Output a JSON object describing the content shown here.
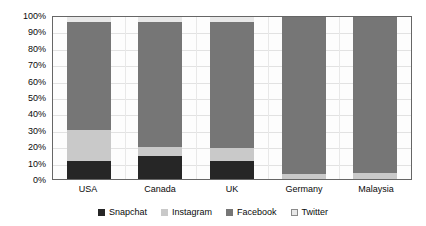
{
  "chart_data": {
    "type": "bar",
    "subtype": "stacked-100-percent",
    "title": "",
    "xlabel": "",
    "ylabel": "",
    "categories": [
      "USA",
      "Canada",
      "UK",
      "Germany",
      "Malaysia"
    ],
    "series": [
      {
        "name": "Snapchat",
        "color": "#262626",
        "values": [
          11,
          14,
          11,
          0,
          0
        ]
      },
      {
        "name": "Instagram",
        "color": "#c9c9c9",
        "values": [
          19,
          6,
          8,
          3,
          4
        ]
      },
      {
        "name": "Facebook",
        "color": "#767676",
        "values": [
          67,
          77,
          78,
          97,
          96
        ]
      },
      {
        "name": "Twitter",
        "color": "#e8e8e8",
        "values": [
          3,
          3,
          3,
          0,
          0
        ]
      }
    ],
    "ylim": [
      0,
      100
    ],
    "y_ticks": [
      "100%",
      "90%",
      "80%",
      "70%",
      "60%",
      "50%",
      "40%",
      "30%",
      "20%",
      "10%",
      "0%"
    ],
    "y_tick_values": [
      100,
      90,
      80,
      70,
      60,
      50,
      40,
      30,
      20,
      10,
      0
    ],
    "grid": true,
    "grid_axis": "y",
    "legend_position": "bottom",
    "legend_entries": [
      "Snapchat",
      "Instagram",
      "Facebook",
      "Twitter"
    ]
  },
  "colors": {
    "snapchat": "#262626",
    "instagram": "#c9c9c9",
    "facebook": "#767676",
    "twitter": "#e8e8e8",
    "axis": "#666666",
    "gridline": "#e2e2e2",
    "text": "#0a0a0a",
    "plot_background": "#fdfdfd",
    "page_background": "#ffffff"
  }
}
